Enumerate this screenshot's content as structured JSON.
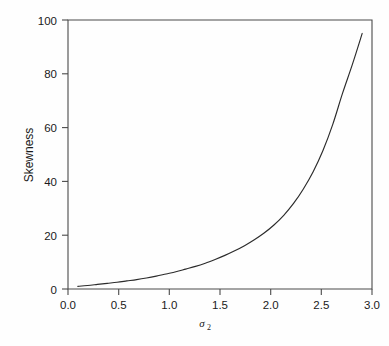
{
  "chart_data": {
    "type": "line",
    "title": "",
    "xlabel": "σ₂",
    "xlabel_symbol": "σ",
    "xlabel_subscript": "2",
    "ylabel": "Skewness",
    "xlim": [
      0.0,
      3.1
    ],
    "ylim": [
      0,
      100
    ],
    "xticks": [
      0.0,
      0.5,
      1.0,
      1.5,
      2.0,
      2.5,
      3.0
    ],
    "xtick_labels": [
      "0.0",
      "0.5",
      "1.0",
      "1.5",
      "2.0",
      "2.5",
      "3.0"
    ],
    "yticks": [
      0,
      20,
      40,
      60,
      80,
      100
    ],
    "ytick_labels": [
      "0",
      "20",
      "40",
      "60",
      "80",
      "100"
    ],
    "grid": false,
    "legend": false,
    "line_color": "#2b2b2b",
    "background_color": "#ffffff",
    "frame_color": "#4a4a4a",
    "series": [
      {
        "name": "Skewness",
        "x": [
          0.1,
          0.2,
          0.3,
          0.4,
          0.5,
          0.6,
          0.7,
          0.8,
          0.9,
          1.0,
          1.1,
          1.2,
          1.3,
          1.4,
          1.5,
          1.6,
          1.7,
          1.8,
          1.9,
          2.0,
          2.1,
          2.2,
          2.3,
          2.4,
          2.5,
          2.6,
          2.7,
          2.8,
          2.9,
          3.0
        ],
        "values": [
          1.0,
          1.3,
          1.7,
          2.1,
          2.5,
          3.0,
          3.5,
          4.1,
          4.8,
          5.6,
          6.4,
          7.4,
          8.4,
          9.6,
          11.0,
          12.5,
          14.2,
          16.1,
          18.3,
          20.8,
          23.8,
          27.4,
          31.8,
          37.2,
          43.6,
          51.5,
          61.2,
          72.8,
          83.5,
          95.0
        ]
      }
    ]
  },
  "plot_geometry": {
    "left": 68,
    "right": 372,
    "top": 20,
    "bottom": 289
  }
}
